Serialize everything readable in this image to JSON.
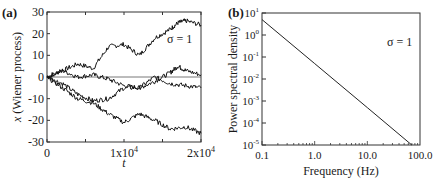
{
  "chart_data": [
    {
      "panel": "(a)",
      "type": "line",
      "title": "",
      "xlabel": "t",
      "ylabel": "x (Wiener process)",
      "xlim": [
        0,
        20000
      ],
      "ylim": [
        -30,
        30
      ],
      "xticks": [
        "0",
        "1x10^4",
        "2x10^4"
      ],
      "yticks": [
        "30",
        "20",
        "10",
        "0",
        "-10",
        "-20",
        "-30"
      ],
      "annotation": "σ = 1",
      "grid": false,
      "legend": "none",
      "series": [
        {
          "name": "path-1",
          "x": [
            0,
            2000,
            4000,
            6000,
            8000,
            10000,
            12000,
            14000,
            16000,
            17000,
            18000,
            20000
          ],
          "values": [
            0,
            3,
            6,
            4,
            14,
            15,
            10,
            18,
            22,
            25,
            26,
            24
          ]
        },
        {
          "name": "path-2",
          "x": [
            0,
            2000,
            4000,
            6000,
            8000,
            10000,
            12000,
            14000,
            16000,
            17000,
            18000,
            20000
          ],
          "values": [
            0,
            3,
            0,
            1,
            -1,
            -4,
            -5,
            -2,
            2,
            5,
            3,
            1
          ]
        },
        {
          "name": "path-3",
          "x": [
            0,
            2000,
            4000,
            6000,
            8000,
            10000,
            12000,
            14000,
            16000,
            18000,
            20000
          ],
          "values": [
            0,
            -3,
            -8,
            -11,
            -10,
            -5,
            -5,
            0,
            -3,
            -4,
            -5
          ]
        },
        {
          "name": "path-4",
          "x": [
            0,
            2000,
            4000,
            6000,
            8000,
            10000,
            12000,
            14000,
            16000,
            18000,
            20000
          ],
          "values": [
            0,
            -5,
            -10,
            -12,
            -17,
            -21,
            -17,
            -20,
            -24,
            -23,
            -26
          ]
        }
      ],
      "zero_line": 0
    },
    {
      "panel": "(b)",
      "type": "line",
      "title": "",
      "xlabel": "Frequency (Hz)",
      "ylabel": "Power spectral density",
      "xscale": "log",
      "yscale": "log",
      "xlim": [
        0.1,
        100
      ],
      "ylim": [
        1e-05,
        10
      ],
      "xticks": [
        "0.1",
        "1.0",
        "10.0",
        "100.0"
      ],
      "yticks": [
        "10^1",
        "10^0",
        "10^-1",
        "10^-2",
        "10^-3",
        "10^-4",
        "10^-5"
      ],
      "annotation": "σ = 1",
      "grid": false,
      "legend": "none",
      "series": [
        {
          "name": "PSD ∝ 1/f²",
          "x": [
            0.1,
            1,
            10,
            70
          ],
          "values": [
            5,
            0.05,
            0.0005,
            1e-05
          ]
        }
      ]
    }
  ],
  "panels": {
    "a": {
      "label": "(a)",
      "annotation": "σ = 1",
      "xlabel": "t",
      "ylabel": "x (Wiener process)"
    },
    "b": {
      "label": "(b)",
      "annotation": "σ = 1",
      "xlabel": "Frequency (Hz)",
      "ylabel": "Power spectral density"
    }
  }
}
